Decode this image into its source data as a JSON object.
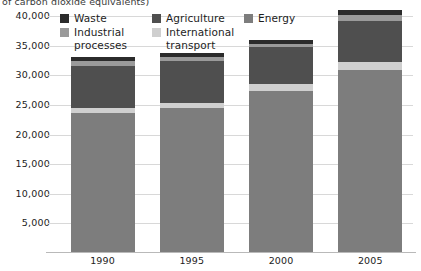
{
  "title_clipped": "of carbon dioxide equivalents)",
  "legend": {
    "position": "top-left-inside",
    "items": [
      {
        "label": "Waste",
        "color": "#2b2b2b",
        "x": 0,
        "y": 0
      },
      {
        "label": "Agriculture",
        "color": "#4f4f4f",
        "x": 92,
        "y": 0
      },
      {
        "label": "Energy",
        "color": "#7d7d7d",
        "x": 184,
        "y": 0
      },
      {
        "label": "Industrial\nprocesses",
        "color": "#9a9a9a",
        "x": 0,
        "y": 14
      },
      {
        "label": "International\ntransport",
        "color": "#cfcfcf",
        "x": 92,
        "y": 14
      }
    ]
  },
  "axis": {
    "y_ticks": [
      "40,000",
      "35,000",
      "30,000",
      "25,000",
      "20,000",
      "15,000",
      "10,000",
      "5,000"
    ],
    "y_tick_values": [
      40000,
      35000,
      30000,
      25000,
      20000,
      15000,
      10000,
      5000
    ],
    "x_ticks": [
      "1990",
      "1995",
      "2000",
      "2005"
    ]
  },
  "chart_data": {
    "type": "bar",
    "stacked": true,
    "title": "of carbon dioxide equivalents)",
    "xlabel": "",
    "ylabel": "",
    "ylim": [
      0,
      40000
    ],
    "ytick_step": 5000,
    "grid": true,
    "legend_position": "top-left",
    "categories": [
      "1990",
      "1995",
      "2000",
      "2005"
    ],
    "series": [
      {
        "name": "Energy",
        "color": "#7d7d7d",
        "values": [
          23600,
          24500,
          27400,
          30900
        ]
      },
      {
        "name": "International transport",
        "color": "#cfcfcf",
        "values": [
          800,
          900,
          1100,
          1400
        ]
      },
      {
        "name": "Agriculture",
        "color": "#4f4f4f",
        "values": [
          7200,
          7000,
          6200,
          6800
        ]
      },
      {
        "name": "Industrial processes",
        "color": "#9a9a9a",
        "values": [
          800,
          700,
          500,
          1100
        ]
      },
      {
        "name": "Waste",
        "color": "#2b2b2b",
        "values": [
          600,
          700,
          800,
          800
        ]
      }
    ],
    "totals": [
      33000,
      33800,
      36000,
      41000
    ]
  },
  "style": {
    "bar_width_px": 64,
    "gridline_color": "#d8d8d8",
    "background": "#ffffff"
  }
}
